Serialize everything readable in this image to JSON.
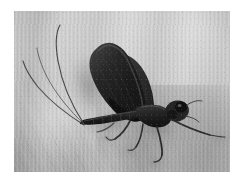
{
  "page": {
    "type": "photograph",
    "width": 244,
    "height": 184,
    "background_color": "#ffffff",
    "caption": ""
  },
  "photo": {
    "name": "mayfly-macro-photograph",
    "subject": "mayfly",
    "alt_text": "Close-up grayscale photograph of a mayfly resting on a pale textured wooden surface, with two long tail filaments sweeping up to the left and dark folded wings held upright.",
    "color_mode": "grayscale",
    "frame": {
      "left": 14,
      "top": 11,
      "width": 216,
      "height": 161
    },
    "palette": {
      "surface_light": "#d9d9d9",
      "surface_mid": "#c2c2c2",
      "surface_dark": "#a4a4a4",
      "shadow": "#9a9a9a",
      "insect_body": "#2a2a2a",
      "insect_dark": "#151515",
      "insect_highlight": "#6e6e6e",
      "margin": "#ffffff"
    },
    "subject_parts": [
      {
        "name": "forewing",
        "description": "large dark upright folded forewing"
      },
      {
        "name": "hindwing",
        "description": "smaller dark wing behind forewing"
      },
      {
        "name": "abdomen",
        "description": "segmented dark abdomen angled down-left"
      },
      {
        "name": "thorax",
        "description": "bulky dark thorax"
      },
      {
        "name": "head",
        "description": "rounded head with large compound eyes"
      },
      {
        "name": "cercus-upper",
        "description": "long curved tail filament sweeping up-left"
      },
      {
        "name": "cercus-lower",
        "description": "second long tail filament sweeping left"
      },
      {
        "name": "foreleg",
        "description": "long foreleg extended forward to the right"
      },
      {
        "name": "midleg",
        "description": "middle leg bent downward"
      },
      {
        "name": "hindleg",
        "description": "hind leg bent downward-left"
      },
      {
        "name": "cast-shadow",
        "description": "soft gray shadow cast to the left of the wing"
      }
    ]
  }
}
